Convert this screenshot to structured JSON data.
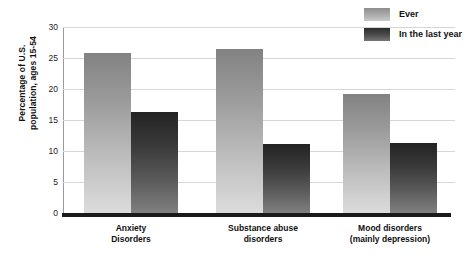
{
  "chart_data": {
    "type": "bar",
    "title": "",
    "subtitle": "",
    "xlabel": "",
    "ylabel": "Percentage of U.S.\npopulation, ages 15-54",
    "ylabel_line1": "Percentage of U.S.",
    "ylabel_line2": "population, ages 15-54",
    "categories": [
      "Anxiety\nDisorders",
      "Substance abuse\ndisorders",
      "Mood disorders\n(mainly depression)"
    ],
    "category_lines": [
      [
        "Anxiety",
        "Disorders"
      ],
      [
        "Substance abuse",
        "disorders"
      ],
      [
        "Mood disorders",
        "(mainly depression)"
      ]
    ],
    "series": [
      {
        "name": "Ever",
        "values": [
          25.8,
          26.5,
          19.2
        ],
        "color": "#a7a7a7"
      },
      {
        "name": "In the last year",
        "values": [
          16.3,
          11.1,
          11.3
        ],
        "color": "#4a4a4a"
      }
    ],
    "ylim": [
      0,
      30
    ],
    "yticks": [
      0,
      5,
      10,
      15,
      20,
      25,
      30
    ],
    "ytick_labels": [
      "0",
      "5",
      "10",
      "15",
      "20",
      "25",
      "30"
    ],
    "grid": true,
    "grid_axis": "y",
    "legend_position": "top-right"
  },
  "legend": {
    "items": [
      {
        "label": "Ever",
        "swatch": "ever"
      },
      {
        "label": "In the last year",
        "swatch": "last"
      }
    ]
  }
}
